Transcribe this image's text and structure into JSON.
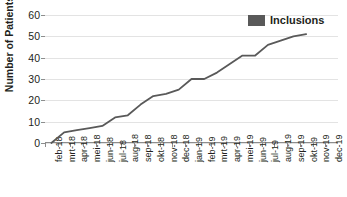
{
  "chart_data": {
    "type": "line",
    "title": "",
    "xlabel": "",
    "ylabel": "Number of Patients",
    "ylim": [
      0,
      60
    ],
    "ytick_step": 10,
    "yticks": [
      0,
      10,
      20,
      30,
      40,
      50,
      60
    ],
    "grid": true,
    "legend_position": "top-right",
    "categories": [
      "feb-18",
      "mrt-18",
      "apr-18",
      "mei-18",
      "jun-18",
      "jul-18",
      "aug-18",
      "sep-18",
      "okt-18",
      "nov-18",
      "dec-18",
      "jan-19",
      "feb-19",
      "mrt-19",
      "apr-19",
      "mei-19",
      "jun-19",
      "jul-19",
      "aug-19",
      "sep-19",
      "okt-19",
      "nov-19",
      "dec-19"
    ],
    "series": [
      {
        "name": "Inclusions",
        "color": "#595959",
        "values": [
          0,
          5,
          6,
          7,
          8,
          12,
          13,
          18,
          22,
          23,
          25,
          30,
          30,
          33,
          37,
          41,
          41,
          46,
          48,
          50,
          51,
          null,
          null
        ]
      }
    ]
  },
  "legend": {
    "entries": [
      {
        "label": "Inclusions",
        "color": "#595959",
        "marker": "square-swatch"
      }
    ]
  },
  "axes": {
    "y_title": "Number of Patients",
    "y_labels": [
      "60",
      "50",
      "40",
      "30",
      "20",
      "10",
      "0"
    ],
    "x_labels": [
      "feb-18",
      "mrt-18",
      "apr-18",
      "mei-18",
      "jun-18",
      "jul-18",
      "aug-18",
      "sep-18",
      "okt-18",
      "nov-18",
      "dec-18",
      "jan-19",
      "feb-19",
      "mrt-19",
      "apr-19",
      "mei-19",
      "jun-19",
      "jul-19",
      "aug-19",
      "sep-19",
      "okt-19",
      "nov-19",
      "dec-19"
    ]
  },
  "colors": {
    "series": "#595959",
    "grid": "#e3e3e3",
    "axis": "#8d8d8d",
    "text": "#231f20",
    "background": "#ffffff"
  }
}
